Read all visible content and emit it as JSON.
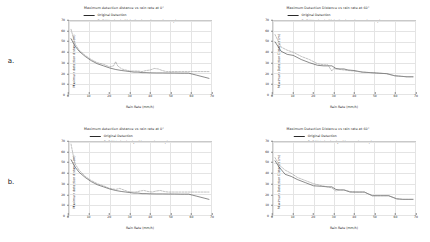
{
  "figure": {
    "rows": [
      {
        "label": "a.",
        "panels": [
          {
            "title": "Maximum detection distance vs rain rate at 0°",
            "legend": [
              {
                "name": "Original Detection",
                "style": "solid"
              },
              {
                "name": "PuGAN trained with both rain and non-rain samples",
                "style": "dashed"
              }
            ],
            "chart_data": {
              "type": "line",
              "title": "Maximum detection distance vs rain rate at 0°",
              "xlabel": "Rain Rate (mm/h)",
              "ylabel": "Maximum detection distance (m)",
              "xlim": [
                0,
                70
              ],
              "ylim": [
                0,
                70
              ],
              "xticks": [
                0,
                10,
                20,
                30,
                40,
                50,
                60,
                70
              ],
              "yticks": [
                0,
                10,
                20,
                30,
                40,
                50,
                60,
                70
              ],
              "grid": true,
              "legend_position": "top-center",
              "series": [
                {
                  "name": "Original Detection",
                  "style": "solid",
                  "color": "#2a2a2a",
                  "x": [
                    1,
                    3,
                    5,
                    8,
                    11,
                    14,
                    17,
                    20,
                    23,
                    26,
                    28,
                    30,
                    32,
                    34,
                    36,
                    38,
                    40,
                    43,
                    46,
                    49,
                    52,
                    55,
                    57,
                    59,
                    61,
                    63,
                    65,
                    67,
                    69
                  ],
                  "y": [
                    53,
                    46,
                    41,
                    36,
                    32,
                    29,
                    27,
                    25,
                    23.5,
                    22.5,
                    22,
                    21.5,
                    21,
                    21,
                    20.5,
                    20.5,
                    20.3,
                    20.2,
                    20.2,
                    20.1,
                    20.1,
                    20,
                    20,
                    20,
                    19,
                    18,
                    17,
                    16,
                    15
                  ]
                },
                {
                  "name": "PuGAN trained with both rain and non-rain samples",
                  "style": "dashed",
                  "color": "#8d8d8d",
                  "x": [
                    1,
                    3,
                    5,
                    8,
                    11,
                    14,
                    17,
                    20,
                    22,
                    23,
                    24,
                    26,
                    28,
                    30,
                    32,
                    34,
                    36,
                    38,
                    40,
                    42,
                    44,
                    46,
                    48,
                    50,
                    52,
                    55,
                    57,
                    59,
                    61,
                    63,
                    65,
                    67,
                    69
                  ],
                  "y": [
                    62,
                    48,
                    42,
                    37,
                    33,
                    30,
                    28.5,
                    26,
                    27,
                    31,
                    27,
                    24,
                    23,
                    22,
                    22,
                    22,
                    21.5,
                    22.5,
                    23,
                    24.5,
                    24,
                    22.5,
                    21.5,
                    21.5,
                    21.5,
                    21.5,
                    21.5,
                    21.5,
                    21.5,
                    21.5,
                    21.5,
                    21.5,
                    21.5
                  ]
                }
              ]
            }
          },
          {
            "title": "Maximum Detection Distance vs rain rate at 60°",
            "legend": [
              {
                "name": "Original Detection",
                "style": "solid"
              },
              {
                "name": "PuGAN trained with both rain and non-rain samples",
                "style": "dashed"
              }
            ],
            "chart_data": {
              "type": "line",
              "title": "Maximum Detection Distance vs rain rate at 60°",
              "xlabel": "Rain Rate (mm/h)",
              "ylabel": "Maximum Detection Distance (m)",
              "xlim": [
                0,
                70
              ],
              "ylim": [
                0,
                70
              ],
              "xticks": [
                0,
                10,
                20,
                30,
                40,
                50,
                60,
                70
              ],
              "yticks": [
                0,
                10,
                20,
                30,
                40,
                50,
                60,
                70
              ],
              "grid": true,
              "legend_position": "top-center",
              "series": [
                {
                  "name": "Original Detection",
                  "style": "solid",
                  "color": "#2a2a2a",
                  "x": [
                    1,
                    4,
                    7,
                    10,
                    14,
                    18,
                    22,
                    25,
                    27,
                    29,
                    31,
                    33,
                    35,
                    37,
                    40,
                    44,
                    48,
                    52,
                    56,
                    60,
                    63,
                    66,
                    69
                  ],
                  "y": [
                    50,
                    41,
                    38,
                    37,
                    33,
                    30,
                    27.5,
                    27,
                    27,
                    27,
                    24.5,
                    24,
                    24,
                    23,
                    22.5,
                    21,
                    20.5,
                    20,
                    19.5,
                    17.5,
                    17,
                    16.5,
                    16.5
                  ]
                },
                {
                  "name": "PuGAN trained with both rain and non-rain samples",
                  "style": "dashed",
                  "color": "#8d8d8d",
                  "x": [
                    1,
                    4,
                    7,
                    10,
                    14,
                    18,
                    22,
                    25,
                    27,
                    28,
                    29,
                    30,
                    31,
                    33,
                    35,
                    37,
                    40,
                    44,
                    48,
                    52,
                    56,
                    60,
                    63,
                    66,
                    69
                  ],
                  "y": [
                    57,
                    45,
                    42,
                    40,
                    36,
                    33,
                    29,
                    28,
                    28,
                    25,
                    22,
                    24.5,
                    24,
                    23.5,
                    23,
                    22.5,
                    22,
                    21,
                    20.5,
                    20,
                    19.5,
                    17.5,
                    17,
                    16.5,
                    16.5
                  ]
                }
              ]
            }
          }
        ]
      },
      {
        "label": "b.",
        "panels": [
          {
            "title": "Maximum detection distance vs rain rate at 0°",
            "legend": [
              {
                "name": "Original Detection",
                "style": "solid"
              },
              {
                "name": "PuGAN trained only with non-rain samples",
                "style": "dashed"
              }
            ],
            "chart_data": {
              "type": "line",
              "title": "Maximum detection distance vs rain rate at 0°",
              "xlabel": "Rain Rate (mm/h)",
              "ylabel": "Maximum detection distance (m)",
              "xlim": [
                0,
                70
              ],
              "ylim": [
                0,
                70
              ],
              "xticks": [
                0,
                10,
                20,
                30,
                40,
                50,
                60,
                70
              ],
              "yticks": [
                0,
                10,
                20,
                30,
                40,
                50,
                60,
                70
              ],
              "grid": true,
              "legend_position": "top-center",
              "series": [
                {
                  "name": "Original Detection",
                  "style": "solid",
                  "color": "#2a2a2a",
                  "x": [
                    1,
                    3,
                    5,
                    8,
                    11,
                    14,
                    17,
                    20,
                    23,
                    26,
                    28,
                    30,
                    32,
                    34,
                    36,
                    38,
                    40,
                    43,
                    46,
                    49,
                    52,
                    55,
                    57,
                    59,
                    61,
                    63,
                    65,
                    67,
                    69
                  ],
                  "y": [
                    53,
                    46,
                    41,
                    36,
                    32,
                    29,
                    27,
                    25,
                    23.5,
                    22.5,
                    22,
                    21.5,
                    21,
                    21,
                    20.5,
                    20.5,
                    20.3,
                    20.2,
                    20.2,
                    20.1,
                    20.1,
                    20,
                    20,
                    20,
                    19,
                    18,
                    17,
                    16,
                    15
                  ]
                },
                {
                  "name": "PuGAN trained only with non-rain samples",
                  "style": "dashed",
                  "color": "#8d8d8d",
                  "x": [
                    1,
                    2,
                    3,
                    5,
                    8,
                    11,
                    14,
                    17,
                    20,
                    23,
                    25,
                    27,
                    29,
                    31,
                    33,
                    35,
                    37,
                    39,
                    41,
                    43,
                    45,
                    47,
                    49,
                    51,
                    53,
                    55,
                    57,
                    59,
                    61,
                    63,
                    65,
                    67,
                    69
                  ],
                  "y": [
                    68,
                    58,
                    49,
                    43,
                    37,
                    33,
                    30,
                    28,
                    25.5,
                    24.5,
                    25.5,
                    24,
                    22.5,
                    22,
                    22,
                    23,
                    23.5,
                    22.5,
                    22,
                    23,
                    23.5,
                    22.5,
                    22,
                    22,
                    22,
                    22,
                    22,
                    22,
                    22,
                    22,
                    22,
                    22,
                    22
                  ]
                }
              ]
            }
          },
          {
            "title": "Maximum Detection Distance vs rain rate at 60°",
            "legend": [
              {
                "name": "Original Detection",
                "style": "solid"
              },
              {
                "name": "PuGAN trained only with non-rain samples",
                "style": "dashed"
              }
            ],
            "chart_data": {
              "type": "line",
              "title": "Maximum Detection Distance vs rain rate at 60°",
              "xlabel": "Rain Rate (mm/h)",
              "ylabel": "Maximum Detection Distance (m)",
              "xlim": [
                0,
                70
              ],
              "ylim": [
                0,
                70
              ],
              "xticks": [
                0,
                10,
                20,
                30,
                40,
                50,
                60,
                70
              ],
              "yticks": [
                0,
                10,
                20,
                30,
                40,
                50,
                60,
                70
              ],
              "grid": true,
              "legend_position": "top-center",
              "series": [
                {
                  "name": "Original Detection",
                  "style": "solid",
                  "color": "#2a2a2a",
                  "x": [
                    1,
                    3,
                    6,
                    9,
                    12,
                    16,
                    20,
                    24,
                    27,
                    29,
                    31,
                    33,
                    35,
                    38,
                    41,
                    45,
                    49,
                    53,
                    57,
                    61,
                    64,
                    67,
                    69
                  ],
                  "y": [
                    52,
                    46,
                    39,
                    37,
                    34,
                    31,
                    28,
                    27.5,
                    27,
                    27,
                    24.5,
                    24,
                    24,
                    22,
                    22,
                    22,
                    18.5,
                    18.5,
                    18.5,
                    15.5,
                    15,
                    15,
                    15
                  ]
                },
                {
                  "name": "PuGAN trained only with non-rain samples",
                  "style": "dashed",
                  "color": "#8d8d8d",
                  "x": [
                    1,
                    3,
                    6,
                    9,
                    12,
                    16,
                    20,
                    24,
                    27,
                    29,
                    31,
                    33,
                    35,
                    38,
                    41,
                    45,
                    49,
                    53,
                    57,
                    61,
                    64,
                    67,
                    69
                  ],
                  "y": [
                    55,
                    48,
                    43,
                    40,
                    36,
                    33,
                    30,
                    28,
                    27,
                    26,
                    23,
                    24,
                    24,
                    22.5,
                    22,
                    22,
                    18.5,
                    18.5,
                    18.5,
                    15.5,
                    15,
                    15,
                    15
                  ]
                }
              ]
            }
          }
        ]
      }
    ]
  }
}
